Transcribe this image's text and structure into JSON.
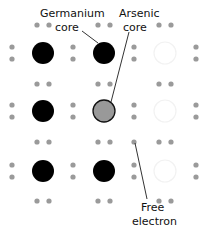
{
  "diagram": {
    "labels": {
      "germanium": [
        "Germanium",
        "core"
      ],
      "arsenic": [
        "Arsenic",
        "core"
      ],
      "free_electron": [
        "Free",
        "electron"
      ]
    },
    "grid": {
      "rows": 3,
      "cols": 3,
      "cores": [
        [
          "germanium",
          "germanium",
          "faint"
        ],
        [
          "germanium",
          "arsenic",
          "faint"
        ],
        [
          "germanium",
          "germanium",
          "faint"
        ]
      ]
    },
    "colors": {
      "germanium": "#000000",
      "arsenic": "#999999",
      "electron": "#9a9a9a",
      "faint": "#f2f2f2",
      "leader": "#333333"
    }
  }
}
